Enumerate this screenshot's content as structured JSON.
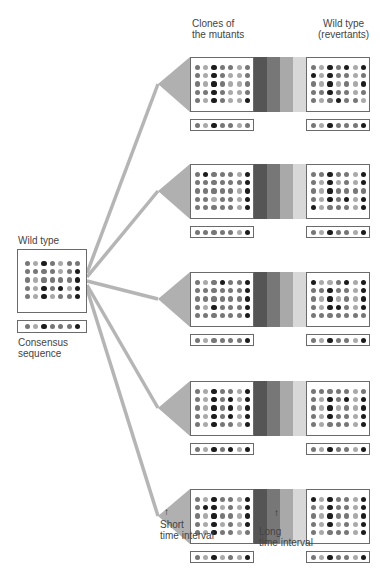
{
  "labels": {
    "wild_type": "Wild type",
    "consensus_line1": "Consensus",
    "consensus_line2": "sequence",
    "clones_line1": "Clones of",
    "clones_line2": "the mutants",
    "revertants_line1": "Wild type",
    "revertants_line2": "(revertants)",
    "short_line1": "Short",
    "short_line2": "time interval",
    "long_line1": "Long",
    "long_line2": "time interval"
  },
  "colors": {
    "dot_levels": [
      "#a9a9a9",
      "#777777",
      "#1c1c1c"
    ],
    "bands": [
      "#555555",
      "#777777",
      "#a9a9a9",
      "#d8d8d8"
    ],
    "branch": "#b5b5b5",
    "fan": "#b0b0b0",
    "border": "#6a6a6a"
  },
  "wild_type": {
    "grid": [
      [
        1,
        0,
        2,
        1,
        0,
        1,
        1
      ],
      [
        1,
        1,
        1,
        1,
        0,
        1,
        2
      ],
      [
        1,
        0,
        1,
        1,
        1,
        1,
        2
      ],
      [
        1,
        0,
        2,
        1,
        2,
        0,
        2
      ],
      [
        1,
        0,
        2,
        0,
        1,
        1,
        2
      ]
    ],
    "consensus": [
      1,
      0,
      2,
      1,
      1,
      1,
      2
    ]
  },
  "rows": [
    {
      "clone": [
        [
          1,
          0,
          2,
          1,
          1,
          0,
          1
        ],
        [
          1,
          0,
          2,
          1,
          0,
          0,
          1
        ],
        [
          1,
          0,
          2,
          1,
          0,
          0,
          1
        ],
        [
          1,
          1,
          2,
          1,
          0,
          0,
          1
        ],
        [
          1,
          0,
          2,
          1,
          0,
          0,
          2
        ]
      ],
      "clone_consensus": [
        1,
        0,
        2,
        1,
        1,
        0,
        1
      ],
      "revertant": [
        [
          1,
          0,
          2,
          1,
          2,
          0,
          2
        ],
        [
          2,
          0,
          2,
          1,
          1,
          0,
          1
        ],
        [
          1,
          0,
          2,
          0,
          1,
          0,
          2
        ],
        [
          1,
          1,
          2,
          1,
          1,
          0,
          1
        ],
        [
          1,
          0,
          1,
          2,
          1,
          1,
          0
        ]
      ],
      "revertant_consensus": [
        1,
        0,
        2,
        1,
        1,
        1,
        2
      ]
    },
    {
      "clone": [
        [
          1,
          2,
          1,
          1,
          1,
          0,
          2
        ],
        [
          1,
          1,
          1,
          1,
          1,
          1,
          2
        ],
        [
          1,
          1,
          1,
          1,
          1,
          0,
          2
        ],
        [
          1,
          1,
          0,
          1,
          1,
          0,
          2
        ],
        [
          1,
          1,
          1,
          1,
          1,
          0,
          2
        ]
      ],
      "clone_consensus": [
        1,
        1,
        1,
        1,
        1,
        0,
        2
      ],
      "revertant": [
        [
          1,
          1,
          2,
          1,
          1,
          0,
          2
        ],
        [
          1,
          0,
          2,
          0,
          1,
          0,
          2
        ],
        [
          1,
          0,
          2,
          1,
          1,
          1,
          1
        ],
        [
          1,
          0,
          2,
          1,
          2,
          0,
          2
        ],
        [
          2,
          0,
          1,
          1,
          1,
          0,
          2
        ]
      ],
      "revertant_consensus": [
        1,
        0,
        2,
        1,
        1,
        0,
        2
      ]
    },
    {
      "clone": [
        [
          1,
          0,
          1,
          2,
          1,
          1,
          2
        ],
        [
          1,
          1,
          1,
          1,
          1,
          1,
          2
        ],
        [
          1,
          1,
          1,
          1,
          1,
          1,
          2
        ],
        [
          1,
          0,
          2,
          1,
          1,
          1,
          2
        ],
        [
          1,
          1,
          1,
          1,
          1,
          1,
          2
        ]
      ],
      "clone_consensus": [
        1,
        0,
        1,
        1,
        1,
        1,
        2
      ],
      "revertant": [
        [
          2,
          0,
          0,
          1,
          2,
          0,
          2
        ],
        [
          1,
          1,
          2,
          1,
          1,
          0,
          2
        ],
        [
          1,
          0,
          2,
          0,
          1,
          0,
          2
        ],
        [
          1,
          0,
          2,
          2,
          1,
          0,
          2
        ],
        [
          1,
          1,
          1,
          1,
          1,
          1,
          1
        ]
      ],
      "revertant_consensus": [
        1,
        0,
        2,
        1,
        1,
        0,
        2
      ]
    },
    {
      "clone": [
        [
          1,
          0,
          2,
          1,
          1,
          0,
          2
        ],
        [
          1,
          0,
          2,
          1,
          2,
          0,
          2
        ],
        [
          1,
          0,
          2,
          1,
          2,
          0,
          2
        ],
        [
          1,
          0,
          2,
          1,
          2,
          0,
          2
        ],
        [
          1,
          0,
          2,
          1,
          1,
          0,
          2
        ]
      ],
      "clone_consensus": [
        1,
        0,
        2,
        1,
        2,
        0,
        2
      ],
      "revertant": [
        [
          1,
          1,
          1,
          1,
          1,
          0,
          1
        ],
        [
          1,
          0,
          2,
          1,
          2,
          0,
          2
        ],
        [
          1,
          0,
          2,
          0,
          1,
          0,
          2
        ],
        [
          1,
          0,
          2,
          1,
          1,
          0,
          2
        ],
        [
          1,
          0,
          1,
          1,
          1,
          0,
          2
        ]
      ],
      "revertant_consensus": [
        1,
        0,
        2,
        1,
        1,
        0,
        2
      ]
    },
    {
      "clone": [
        [
          1,
          0,
          2,
          1,
          1,
          0,
          2
        ],
        [
          1,
          2,
          2,
          0,
          1,
          0,
          2
        ],
        [
          1,
          0,
          2,
          1,
          1,
          0,
          2
        ],
        [
          1,
          0,
          2,
          0,
          1,
          0,
          2
        ],
        [
          1,
          0,
          2,
          1,
          1,
          0,
          1
        ]
      ],
      "clone_consensus": [
        1,
        0,
        2,
        0,
        1,
        0,
        2
      ],
      "revertant": [
        [
          2,
          0,
          2,
          1,
          1,
          0,
          2
        ],
        [
          1,
          0,
          2,
          1,
          1,
          0,
          2
        ],
        [
          1,
          0,
          2,
          1,
          1,
          0,
          2
        ],
        [
          1,
          0,
          2,
          0,
          1,
          0,
          2
        ],
        [
          1,
          0,
          1,
          1,
          1,
          0,
          2
        ]
      ],
      "revertant_consensus": [
        1,
        0,
        2,
        1,
        1,
        0,
        2
      ]
    }
  ]
}
